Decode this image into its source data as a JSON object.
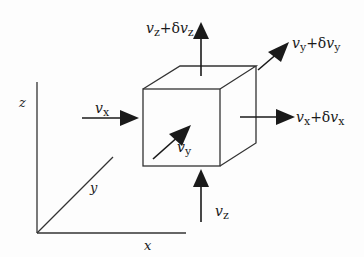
{
  "diagram": {
    "axes": {
      "x_label": "x",
      "y_label": "y",
      "z_label": "z"
    },
    "inflow": {
      "vx": {
        "base": "v",
        "sub": "x"
      },
      "vy": {
        "base": "v",
        "sub": "y"
      },
      "vz": {
        "base": "v",
        "sub": "z"
      }
    },
    "outflow": {
      "vx": {
        "base": "v",
        "sub": "x",
        "plus": "+δ",
        "base2": "v",
        "sub2": "x"
      },
      "vy": {
        "base": "v",
        "sub": "y",
        "plus": "+δ",
        "base2": "v",
        "sub2": "y"
      },
      "vz": {
        "base": "v",
        "sub": "z",
        "plus": "+δ",
        "base2": "v",
        "sub2": "z"
      }
    },
    "colors": {
      "stroke": "#1a1a1a",
      "background": "#fdfdfd"
    }
  }
}
